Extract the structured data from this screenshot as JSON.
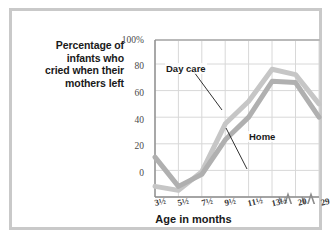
{
  "figure": {
    "y_axis_caption_lines": [
      "Percentage of",
      "infants who",
      "cried when their",
      "mothers left"
    ],
    "x_axis_caption": "Age in months",
    "border_color": "#c9c9c9",
    "background": "#ffffff"
  },
  "chart_data": {
    "type": "line",
    "title": "",
    "subtitle": "",
    "xlabel": "Age in months",
    "ylabel": "Percentage of infants who cried when their mothers left",
    "categories": [
      "3½",
      "5½",
      "7½",
      "9½",
      "11½",
      "13½",
      "20",
      "29"
    ],
    "category_labels_plain": [
      "3 1/2",
      "5 1/2",
      "7 1/2",
      "9 1/2",
      "11 1/2",
      "13 1/2",
      "20",
      "29"
    ],
    "ylim": [
      0,
      118
    ],
    "ytick_values": [
      0,
      20,
      40,
      60,
      80,
      100
    ],
    "ytick_labels": [
      "0",
      "20",
      "40",
      "60",
      "80",
      "100%"
    ],
    "grid": true,
    "grid_color": "#d5d5d5",
    "legend_position": "inline-annotations",
    "axis_break": {
      "present": true,
      "style": "zigzag",
      "after_categories": [
        "13½",
        "20"
      ],
      "note": "x-axis scale breaks between 13½ and 20, and between 20 and 29"
    },
    "series": [
      {
        "name": "Day care",
        "color": "#c6c6c6",
        "values": [
          8,
          5,
          19,
          55,
          72,
          96,
          92,
          70
        ],
        "annotation": {
          "label": "Day care",
          "points_to_category": "9½"
        }
      },
      {
        "name": "Home",
        "color": "#b0b0b0",
        "values": [
          30,
          8,
          17,
          43,
          60,
          87,
          86,
          60
        ],
        "annotation": {
          "label": "Home",
          "points_to_category": "11½"
        }
      }
    ]
  }
}
